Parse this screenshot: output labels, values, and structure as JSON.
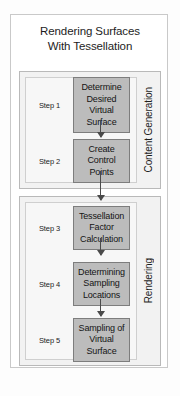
{
  "diagram": {
    "title": {
      "line1": "Rendering Surfaces",
      "line2": "With Tessellation"
    },
    "groups": [
      {
        "name": "content-generation",
        "label": "Content Generation",
        "steps": [
          {
            "step_label": "Step 1",
            "text_line1": "Determine",
            "text_line2": "Desired Virtual",
            "text_line3": "Surface"
          },
          {
            "step_label": "Step 2",
            "text_line1": "Create Control",
            "text_line2": "Points",
            "text_line3": ""
          }
        ]
      },
      {
        "name": "rendering",
        "label": "Rendering",
        "steps": [
          {
            "step_label": "Step 3",
            "text_line1": "Tessellation",
            "text_line2": "Factor Calculation",
            "text_line3": ""
          },
          {
            "step_label": "Step 4",
            "text_line1": "Determining",
            "text_line2": "Sampling",
            "text_line3": "Locations"
          },
          {
            "step_label": "Step 5",
            "text_line1": "Sampling of",
            "text_line2": "Virtual Surface",
            "text_line3": ""
          }
        ]
      }
    ],
    "colors": {
      "step_box_fill": "#bcbcbc",
      "step_box_border": "#7d7d7d",
      "group_fill": "#f2f2f2",
      "group_border": "#b9b9b9",
      "inner_panel_fill": "#f7f7f7",
      "connector": "#4a4a4a",
      "text": "#1d1d1d",
      "page_background": "#ffffff"
    }
  }
}
